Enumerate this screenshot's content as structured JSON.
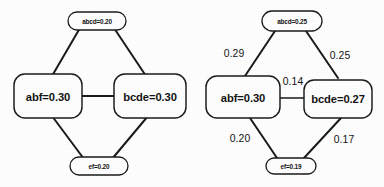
{
  "figure": {
    "type": "diagram",
    "diagrams": [
      {
        "id": "left",
        "has_edge_labels": false,
        "nodes": [
          {
            "id": "top",
            "label": "abcd=0.20",
            "size": "small"
          },
          {
            "id": "left",
            "label": "abf=0.30",
            "size": "large"
          },
          {
            "id": "right",
            "label": "bcde=0.30",
            "size": "large"
          },
          {
            "id": "bottom",
            "label": "ef=0.20",
            "size": "small"
          }
        ],
        "edges": [
          {
            "from": "top",
            "to": "left",
            "label": ""
          },
          {
            "from": "top",
            "to": "right",
            "label": ""
          },
          {
            "from": "left",
            "to": "right",
            "label": ""
          },
          {
            "from": "left",
            "to": "bottom",
            "label": ""
          },
          {
            "from": "right",
            "to": "bottom",
            "label": ""
          }
        ]
      },
      {
        "id": "right",
        "has_edge_labels": true,
        "nodes": [
          {
            "id": "top",
            "label": "abcd=0.25",
            "size": "small"
          },
          {
            "id": "left",
            "label": "abf=0.30",
            "size": "large"
          },
          {
            "id": "right",
            "label": "bcde=0.27",
            "size": "large"
          },
          {
            "id": "bottom",
            "label": "ef=0.19",
            "size": "small"
          }
        ],
        "edges": [
          {
            "from": "top",
            "to": "left",
            "label": "0.29"
          },
          {
            "from": "top",
            "to": "right",
            "label": "0.25"
          },
          {
            "from": "left",
            "to": "right",
            "label": "0.14"
          },
          {
            "from": "left",
            "to": "bottom",
            "label": "0.20"
          },
          {
            "from": "right",
            "to": "bottom",
            "label": "0.17"
          }
        ]
      }
    ]
  },
  "colors": {
    "ink": "#1b1b1b",
    "text": "#141414",
    "background": "#ffffff"
  }
}
